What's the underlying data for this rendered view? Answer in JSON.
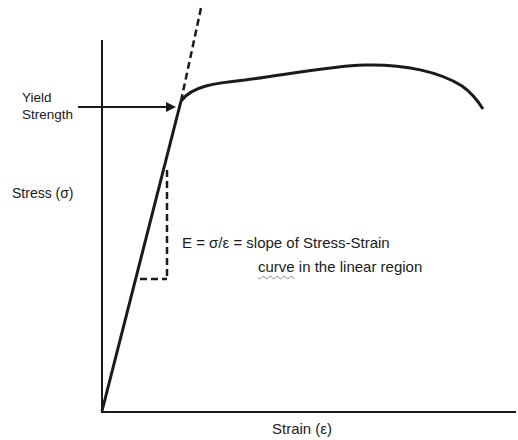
{
  "diagram": {
    "labels": {
      "yield_line1": "Yield",
      "yield_line2": "Strength",
      "y_axis": "Stress (σ)",
      "x_axis": "Strain (ε)",
      "modulus_line1": "E = σ/ε = slope of Stress-Strain",
      "modulus_word_curve": "curve",
      "modulus_line2_rest": " in the linear region"
    },
    "elements": [
      "y-axis",
      "x-axis",
      "linear-elastic-segment",
      "extrapolated-dashed-line",
      "plastic-curve",
      "yield-point-arrow",
      "slope-triangle-dashed"
    ],
    "colors": {
      "line": "#1a1a1a",
      "background": "#ffffff"
    }
  }
}
